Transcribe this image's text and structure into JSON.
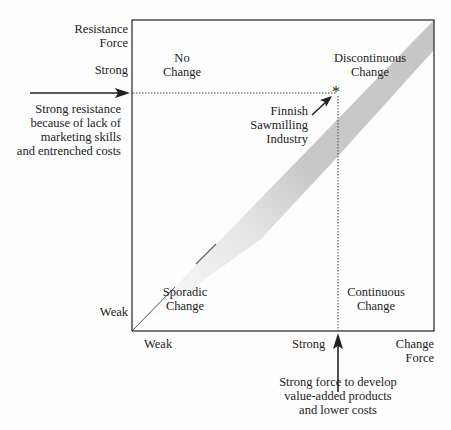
{
  "diagram": {
    "y_axis": {
      "label_line1": "Resistance",
      "label_line2": "Force",
      "strong": "Strong",
      "weak": "Weak"
    },
    "x_axis": {
      "label_line1": "Change",
      "label_line2": "Force",
      "strong": "Strong",
      "weak": "Weak"
    },
    "quadrants": {
      "top_left": {
        "line1": "No",
        "line2": "Change"
      },
      "top_right": {
        "line1": "Discontinuous",
        "line2": "Change"
      },
      "bottom_left": {
        "line1": "Sporadic",
        "line2": "Change"
      },
      "bottom_right": {
        "line1": "Continuous",
        "line2": "Change"
      }
    },
    "marker": {
      "symbol": "*",
      "line1": "Finnish",
      "line2": "Sawmilling",
      "line3": "Industry"
    },
    "left_annotation": {
      "line1": "Strong resistance",
      "line2": "because of lack of",
      "line3": "marketing skills",
      "line4": "and entrenched costs"
    },
    "bottom_annotation": {
      "line1": "Strong force to develop",
      "line2": "value-added products",
      "line3": "and lower costs"
    },
    "colors": {
      "band": "#c8c8c8",
      "line": "#333333"
    }
  }
}
